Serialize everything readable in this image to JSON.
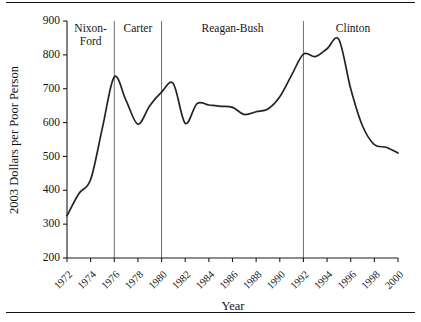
{
  "chart_data": {
    "type": "line",
    "title": "",
    "xlabel": "Year",
    "ylabel": "2003 Dollars per Poor Person",
    "xlim": [
      1972,
      2000
    ],
    "ylim": [
      200,
      900
    ],
    "ytick_values": [
      200,
      300,
      400,
      500,
      600,
      700,
      800,
      900
    ],
    "ytick_labels": [
      "200",
      "300",
      "400",
      "500",
      "600",
      "700",
      "800",
      "900"
    ],
    "xtick_values": [
      1972,
      1974,
      1976,
      1978,
      1980,
      1982,
      1984,
      1986,
      1988,
      1990,
      1992,
      1994,
      1996,
      1998,
      2000
    ],
    "xtick_labels": [
      "1972",
      "1974",
      "1976",
      "1978",
      "1980",
      "1982",
      "1984",
      "1986",
      "1988",
      "1990",
      "1992",
      "1994",
      "1996",
      "1998",
      "2000"
    ],
    "grid": false,
    "legend": false,
    "line_color": "#232323",
    "x": [
      1972,
      1973,
      1974,
      1975,
      1976,
      1977,
      1978,
      1979,
      1980,
      1981,
      1982,
      1983,
      1984,
      1985,
      1986,
      1987,
      1988,
      1989,
      1990,
      1991,
      1992,
      1993,
      1994,
      1995,
      1996,
      1997,
      1998,
      1999,
      2000
    ],
    "values": [
      325,
      390,
      432,
      585,
      735,
      665,
      595,
      650,
      690,
      715,
      598,
      656,
      652,
      648,
      645,
      624,
      632,
      640,
      676,
      740,
      802,
      795,
      818,
      845,
      700,
      590,
      535,
      527,
      510
    ],
    "series": [
      {
        "name": "2003 Dollars per Poor Person",
        "values": [
          325,
          390,
          432,
          585,
          735,
          665,
          595,
          650,
          690,
          715,
          598,
          656,
          652,
          648,
          645,
          624,
          632,
          640,
          676,
          740,
          802,
          795,
          818,
          845,
          700,
          590,
          535,
          527,
          510
        ]
      }
    ],
    "annotations": [
      {
        "label": "Nixon-Ford",
        "label_line1": "Nixon-",
        "label_line2": "Ford",
        "span_start": 1972,
        "span_end": 1976,
        "center": 1974
      },
      {
        "label": "Carter",
        "label_line1": "Carter",
        "label_line2": "",
        "span_start": 1976,
        "span_end": 1980,
        "center": 1978
      },
      {
        "label": "Reagan-Bush",
        "label_line1": "Reagan-Bush",
        "label_line2": "",
        "span_start": 1980,
        "span_end": 1992,
        "center": 1986
      },
      {
        "label": "Clinton",
        "label_line1": "Clinton",
        "label_line2": "",
        "span_start": 1992,
        "span_end": 2000,
        "center": 1996.2
      }
    ],
    "dividers": [
      1976,
      1980,
      1992
    ],
    "divider_color": "#6e6e6e"
  }
}
